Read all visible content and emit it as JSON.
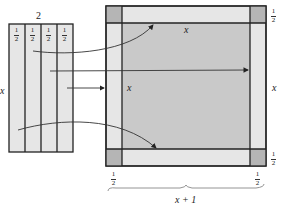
{
  "figure": {
    "left_rectangle": {
      "width_label": "2",
      "height_label": "x",
      "strip_count": 4,
      "strip_labels": [
        "1",
        "1",
        "1",
        "1"
      ],
      "strip_label_denominators": [
        "2",
        "2",
        "2",
        "2"
      ]
    },
    "right_square": {
      "center_label": "x",
      "top_strip_label": "x",
      "left_strip_label": "x",
      "right_side_label": "x",
      "corner_label_top_right": {
        "num": "1",
        "den": "2"
      },
      "corner_label_bottom_right": {
        "num": "1",
        "den": "2"
      },
      "bottom_left_label": {
        "num": "1",
        "den": "2"
      },
      "bottom_right_label": {
        "num": "1",
        "den": "2"
      },
      "brace_label": "x + 1"
    },
    "colors": {
      "strip_fill": "#e6e6e6",
      "center_fill": "#c9c9c9",
      "corner_fill": "#b5b5b5",
      "line": "#222222"
    }
  }
}
